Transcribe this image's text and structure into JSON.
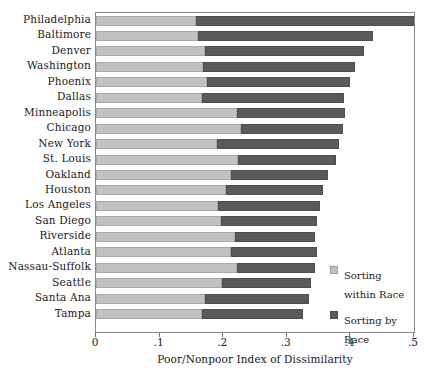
{
  "chart_data": {
    "type": "bar",
    "orientation": "horizontal",
    "stacked": true,
    "title": "",
    "xlabel": "Poor/Nonpoor Index of Dissimilarity",
    "ylabel": "",
    "xlim": [
      0,
      0.5
    ],
    "xticks": [
      0,
      0.1,
      0.2,
      0.3,
      0.4,
      0.5
    ],
    "xticklabels": [
      "0",
      ".1",
      ".2",
      ".3",
      ".4",
      ".5"
    ],
    "grid": false,
    "legend_position": "inside-right-lower",
    "categories": [
      "Philadelphia",
      "Baltimore",
      "Denver",
      "Washington",
      "Phoenix",
      "Dallas",
      "Minneapolis",
      "Chicago",
      "New York",
      "St. Louis",
      "Oakland",
      "Houston",
      "Los Angeles",
      "San Diego",
      "Riverside",
      "Atlanta",
      "Nassau-Suffolk",
      "Seattle",
      "Santa Ana",
      "Tampa"
    ],
    "series": [
      {
        "name": "Sorting within Race",
        "color": "#c2c2c2",
        "values": [
          0.158,
          0.16,
          0.172,
          0.168,
          0.175,
          0.167,
          0.222,
          0.228,
          0.19,
          0.224,
          0.212,
          0.205,
          0.192,
          0.196,
          0.218,
          0.212,
          0.222,
          0.198,
          0.172,
          0.167
        ]
      },
      {
        "name": "Sorting by Race",
        "color": "#5a5a5a",
        "values": [
          0.342,
          0.275,
          0.25,
          0.24,
          0.225,
          0.223,
          0.17,
          0.16,
          0.192,
          0.154,
          0.152,
          0.152,
          0.16,
          0.152,
          0.126,
          0.135,
          0.122,
          0.14,
          0.163,
          0.158
        ]
      }
    ],
    "totals": [
      0.5,
      0.435,
      0.422,
      0.408,
      0.4,
      0.39,
      0.392,
      0.388,
      0.382,
      0.378,
      0.364,
      0.357,
      0.352,
      0.348,
      0.344,
      0.347,
      0.344,
      0.338,
      0.335,
      0.325
    ]
  },
  "legend": {
    "items": [
      {
        "label_line1": "Sorting",
        "label_line2": "within Race"
      },
      {
        "label_line1": "Sorting by",
        "label_line2": "Race"
      }
    ]
  }
}
